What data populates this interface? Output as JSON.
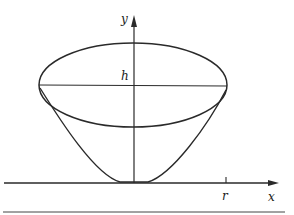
{
  "figure": {
    "labels": {
      "y_axis": "y",
      "x_axis": "x",
      "height": "h",
      "radius": "r"
    },
    "colors": {
      "stroke": "#2a2a2a",
      "background": "#ffffff"
    }
  }
}
